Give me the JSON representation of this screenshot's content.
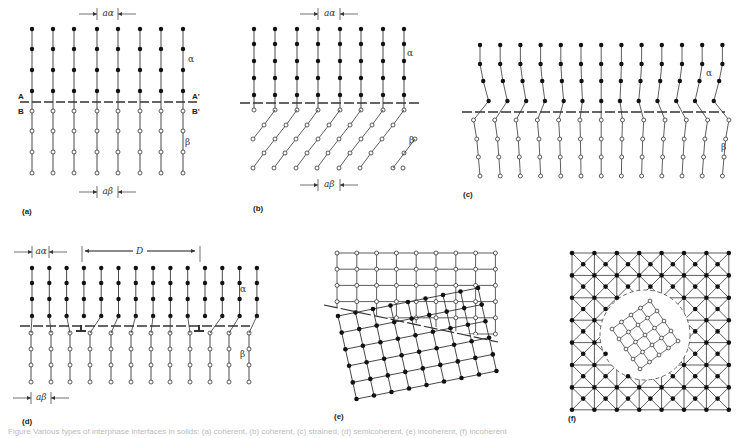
{
  "figure": {
    "panels": [
      {
        "id": "a",
        "label": "(a)",
        "description": "Coherent interface, a_alpha = a_beta",
        "phase_top": "α",
        "phase_bottom": "β",
        "plane_labels": [
          "A",
          "A'",
          "B",
          "B'"
        ],
        "spacing_top": "aα",
        "spacing_bottom": "aβ"
      },
      {
        "id": "b",
        "label": "(b)",
        "description": "Coherent interface between different crystal structures",
        "phase_top": "α",
        "phase_bottom": "β",
        "spacing_top": "aα",
        "spacing_bottom": "aβ"
      },
      {
        "id": "c",
        "label": "(c)",
        "description": "Coherent interface with coherency strains",
        "phase_top": "α",
        "phase_bottom": "β"
      },
      {
        "id": "d",
        "label": "(d)",
        "description": "Semicoherent interface with misfit dislocations",
        "phase_top": "α",
        "phase_bottom": "β",
        "spacing_top": "aα",
        "spacing_bottom": "aβ",
        "dislocation_spacing": "D"
      },
      {
        "id": "e",
        "label": "(e)",
        "description": "Incoherent interface"
      },
      {
        "id": "f",
        "label": "(f)",
        "description": "Incoherent precipitate within matrix"
      }
    ],
    "caption": "Figure    Various types of interphase interfaces in solids: (a) coherent, (b) coherent, (c) strained, (d) semicoherent, (e) incoherent, (f) incoherent"
  }
}
